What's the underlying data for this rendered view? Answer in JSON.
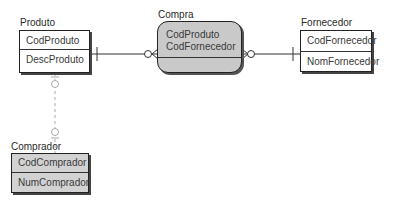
{
  "diagram": {
    "type": "entity-relationship",
    "entities": [
      {
        "id": "produto",
        "name": "Produto",
        "attributes": [
          "CodProduto",
          "DescProduto"
        ]
      },
      {
        "id": "fornecedor",
        "name": "Fornecedor",
        "attributes": [
          "CodFornecedor",
          "NomFornecedor"
        ]
      },
      {
        "id": "comprador",
        "name": "Comprador",
        "attributes": [
          "CodComprador",
          "NumComprador"
        ]
      }
    ],
    "relationship": {
      "id": "compra",
      "name": "Compra",
      "attributes": [
        "CodProduto",
        "CodFornecedor"
      ]
    },
    "connections": [
      {
        "from": "Produto",
        "to": "Compra",
        "style": "solid",
        "from_end": "one",
        "to_end": "zero-or-many"
      },
      {
        "from": "Compra",
        "to": "Fornecedor",
        "style": "solid",
        "from_end": "zero-or-many",
        "to_end": "one"
      },
      {
        "from": "Produto",
        "to": "Comprador",
        "style": "dashed",
        "from_end": "zero-or-one",
        "to_end": "zero-or-one"
      }
    ]
  },
  "colors": {
    "relationship_fill": "#c9c9c9",
    "gray_entity_fill": "#d2d2d2",
    "line": "#333333",
    "dashed_line": "#aaaaaa"
  }
}
